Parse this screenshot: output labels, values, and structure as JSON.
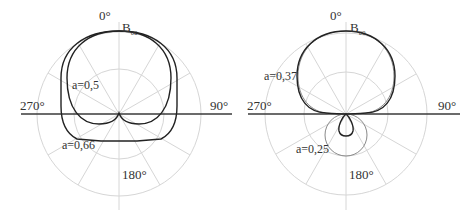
{
  "diagrams": [
    {
      "id": "left",
      "angle_labels": {
        "top": "0°",
        "right": "90°",
        "bottom": "180°",
        "left": "270°"
      },
      "peak_label": {
        "main": "B",
        "sub": "θ0"
      },
      "curves": [
        {
          "label": "a=0,5"
        },
        {
          "label": "a=0,66"
        }
      ]
    },
    {
      "id": "right",
      "angle_labels": {
        "top": "0°",
        "right": "90°",
        "bottom": "180°",
        "left": "270°"
      },
      "peak_label": {
        "main": "B",
        "sub": "θ0"
      },
      "curves": [
        {
          "label": "a=0,37"
        },
        {
          "label": "a=0,25"
        }
      ]
    }
  ],
  "colors": {
    "grid": "#d6d6d6",
    "axis": "#3a3a3a",
    "curve_dark": "#222222",
    "curve_light": "#8a8a8a"
  }
}
